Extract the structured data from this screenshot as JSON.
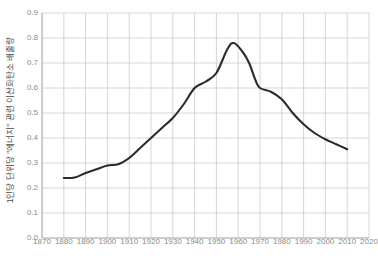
{
  "chart_data": {
    "type": "line",
    "title": "",
    "subtitle": "",
    "xlabel": "",
    "ylabel": "1인당 단위당 \"에너지\" 관련 이산화탄소 배출량",
    "xlim": [
      1870,
      2020
    ],
    "ylim": [
      0.0,
      0.9
    ],
    "grid": true,
    "legend": null,
    "xticks": [
      1870,
      1880,
      1890,
      1900,
      1910,
      1920,
      1930,
      1940,
      1950,
      1960,
      1970,
      1980,
      1990,
      2000,
      2010,
      2020
    ],
    "yticks": [
      "0.0",
      "0.1",
      "0.2",
      "0.3",
      "0.4",
      "0.5",
      "0.6",
      "0.7",
      "0.8",
      "0.9"
    ],
    "line_color": "#2b2b2b",
    "grid_color": "#cccccc",
    "series": [
      {
        "name": "CO2 배출량",
        "x": [
          1880,
          1885,
          1890,
          1895,
          1900,
          1905,
          1910,
          1915,
          1920,
          1925,
          1930,
          1935,
          1940,
          1945,
          1950,
          1955,
          1958,
          1962,
          1965,
          1968,
          1970,
          1975,
          1980,
          1985,
          1990,
          1995,
          2000,
          2005,
          2010
        ],
        "values": [
          0.24,
          0.242,
          0.26,
          0.275,
          0.29,
          0.295,
          0.32,
          0.36,
          0.4,
          0.44,
          0.48,
          0.535,
          0.6,
          0.625,
          0.66,
          0.755,
          0.78,
          0.745,
          0.7,
          0.63,
          0.6,
          0.585,
          0.555,
          0.5,
          0.455,
          0.42,
          0.395,
          0.375,
          0.355
        ]
      }
    ]
  },
  "caption": {
    "text": ""
  }
}
